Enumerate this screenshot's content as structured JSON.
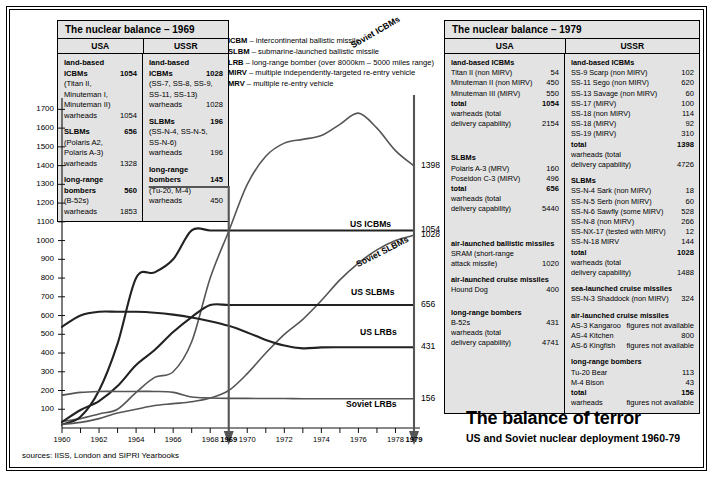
{
  "legend": [
    {
      "abbr": "ICBM",
      "desc": " – intercontinental ballistic missile"
    },
    {
      "abbr": "SLBM",
      "desc": " – submarine-launched ballistic missile"
    },
    {
      "abbr": "LRB",
      "desc": " – long-range bomber (over 8000km – 5000 miles range)"
    },
    {
      "abbr": "MIRV",
      "desc": " – multiple independently-targeted re-entry vehicle"
    },
    {
      "abbr": "MRV",
      "desc": " – multiple re-entry vehicle"
    }
  ],
  "table1969": {
    "title": "The nuclear balance – 1969",
    "head": [
      "USA",
      "USSR"
    ],
    "usa": [
      {
        "label": "land-based",
        "value": "",
        "bold": true
      },
      {
        "label": "ICBMs",
        "value": "1054",
        "bold": true
      },
      {
        "label": "(Titan II,",
        "value": ""
      },
      {
        "label": "Minuteman I,",
        "value": ""
      },
      {
        "label": "Minuteman II)",
        "value": ""
      },
      {
        "label": "warheads",
        "value": "1054"
      },
      {
        "label": "",
        "value": "",
        "gap": true
      },
      {
        "label": "SLBMs",
        "value": "656",
        "bold": true
      },
      {
        "label": "(Polaris A2,",
        "value": ""
      },
      {
        "label": "Polaris A-3)",
        "value": ""
      },
      {
        "label": "warheads",
        "value": "1328"
      },
      {
        "label": "",
        "value": "",
        "gap": true
      },
      {
        "label": "long-range",
        "value": "",
        "bold": true
      },
      {
        "label": "bombers",
        "value": "560",
        "bold": true
      },
      {
        "label": "(B-52s)",
        "value": ""
      },
      {
        "label": "warheads",
        "value": "1853"
      }
    ],
    "ussr": [
      {
        "label": "land-based",
        "value": "",
        "bold": true
      },
      {
        "label": "ICBMs",
        "value": "1028",
        "bold": true
      },
      {
        "label": "(SS-7, SS-8, SS-9,",
        "value": ""
      },
      {
        "label": "SS-11, SS-13)",
        "value": ""
      },
      {
        "label": "warheads",
        "value": "1028"
      },
      {
        "label": "",
        "value": "",
        "gap": true
      },
      {
        "label": "SLBMs",
        "value": "196",
        "bold": true
      },
      {
        "label": "(SS-N-4, SS-N-5,",
        "value": ""
      },
      {
        "label": "SS-N-6)",
        "value": ""
      },
      {
        "label": "warheads",
        "value": "196"
      },
      {
        "label": "",
        "value": "",
        "gap": true
      },
      {
        "label": "long-range",
        "value": "",
        "bold": true
      },
      {
        "label": "bombers",
        "value": "145",
        "bold": true
      },
      {
        "label": "(Tu-20, M-4)",
        "value": ""
      },
      {
        "label": "warheads",
        "value": "450"
      }
    ]
  },
  "table1979": {
    "title": "The nuclear balance – 1979",
    "head": [
      "USA",
      "USSR"
    ],
    "usa": [
      {
        "label": "land-based ICBMs",
        "value": "",
        "bold": true
      },
      {
        "label": "Titan II (non MIRV)",
        "value": "54"
      },
      {
        "label": "Minuteman II (non MIRV)",
        "value": "450"
      },
      {
        "label": "Minuteman III (MIRV)",
        "value": "550"
      },
      {
        "label": "total",
        "value": "1054",
        "bold": true
      },
      {
        "label": "warheads (total",
        "value": ""
      },
      {
        "label": "delivery capability)",
        "value": "2154"
      },
      {
        "label": "",
        "value": "",
        "gap": true
      },
      {
        "label": "",
        "value": "",
        "gap": true
      },
      {
        "label": "",
        "value": "",
        "gap": true
      },
      {
        "label": "",
        "value": "",
        "gap": true
      },
      {
        "label": "SLBMs",
        "value": "",
        "bold": true
      },
      {
        "label": "Polaris A-3 (MRV)",
        "value": "160"
      },
      {
        "label": "Poseidon C-3 (MIRV)",
        "value": "496"
      },
      {
        "label": "total",
        "value": "656",
        "bold": true
      },
      {
        "label": "warheads (total",
        "value": ""
      },
      {
        "label": "delivery capability)",
        "value": "5440"
      },
      {
        "label": "",
        "value": "",
        "gap": true
      },
      {
        "label": "",
        "value": "",
        "gap": true
      },
      {
        "label": "",
        "value": "",
        "gap": true
      },
      {
        "label": "",
        "value": "",
        "gap": true
      },
      {
        "label": "air-launched ballistic missiles",
        "value": "",
        "bold": true
      },
      {
        "label": "SRAM (short-range",
        "value": ""
      },
      {
        "label": "attack missile)",
        "value": "1020"
      },
      {
        "label": "",
        "value": "",
        "gap": true
      },
      {
        "label": "air-launched cruise missiles",
        "value": "",
        "bold": true
      },
      {
        "label": "Hound Dog",
        "value": "400"
      },
      {
        "label": "",
        "value": "",
        "gap": true
      },
      {
        "label": "",
        "value": "",
        "gap": true
      },
      {
        "label": "long-range bombers",
        "value": "",
        "bold": true
      },
      {
        "label": "B-52s",
        "value": "431"
      },
      {
        "label": "warheads (total",
        "value": ""
      },
      {
        "label": "delivery capability)",
        "value": "4741"
      }
    ],
    "ussr": [
      {
        "label": "land-based ICBMs",
        "value": "",
        "bold": true
      },
      {
        "label": "SS-9 Scarp (non MIRV)",
        "value": "102"
      },
      {
        "label": "SS-11 Sego (non MIRV)",
        "value": "620"
      },
      {
        "label": "SS-13 Savage (non MIRV)",
        "value": "60"
      },
      {
        "label": "SS-17 (MIRV)",
        "value": "100"
      },
      {
        "label": "SS-18 (non MIRV)",
        "value": "114"
      },
      {
        "label": "SS-18 (MIRV)",
        "value": "92"
      },
      {
        "label": "SS-19 (MIRV)",
        "value": "310"
      },
      {
        "label": "total",
        "value": "1398",
        "bold": true
      },
      {
        "label": "warheads (total",
        "value": ""
      },
      {
        "label": "delivery capability)",
        "value": "4726"
      },
      {
        "label": "",
        "value": "",
        "gap": true
      },
      {
        "label": "SLBMs",
        "value": "",
        "bold": true
      },
      {
        "label": "SS-N-4 Sark (non MIRV)",
        "value": "18"
      },
      {
        "label": "SS-N-5 Serb (non MIRV)",
        "value": "60"
      },
      {
        "label": "SS-N-6 Sawfly (some MIRV)",
        "value": "528"
      },
      {
        "label": "SS-N-8 (non MIRV)",
        "value": "266"
      },
      {
        "label": "SS-NX-17 (tested with MIRV)",
        "value": "12"
      },
      {
        "label": "SS-N-18 MIRV",
        "value": "144"
      },
      {
        "label": "total",
        "value": "1028",
        "bold": true
      },
      {
        "label": "warheads (total",
        "value": ""
      },
      {
        "label": "delivery capability)",
        "value": "1488"
      },
      {
        "label": "",
        "value": "",
        "gap": true
      },
      {
        "label": "sea-launched cruise missiles",
        "value": "",
        "bold": true
      },
      {
        "label": "SS-N-3 Shaddock (non MIRV)",
        "value": "324"
      },
      {
        "label": "",
        "value": "",
        "gap": true
      },
      {
        "label": "air-launched cruise missiles",
        "value": "",
        "bold": true
      },
      {
        "label": "AS-3 Kangaroo",
        "value": "figures not available"
      },
      {
        "label": "AS-4 Kitchen",
        "value": "800"
      },
      {
        "label": "AS-6 Kingfish",
        "value": "figures not available"
      },
      {
        "label": "",
        "value": "",
        "gap": true
      },
      {
        "label": "long-range bombers",
        "value": "",
        "bold": true
      },
      {
        "label": "Tu-20 Bear",
        "value": "113"
      },
      {
        "label": "M-4 Bison",
        "value": "43"
      },
      {
        "label": "total",
        "value": "156",
        "bold": true
      },
      {
        "label": "warheads",
        "value": "figures not available"
      }
    ]
  },
  "title": {
    "main": "The balance of terror",
    "sub": "US and Soviet nuclear deployment 1960-79"
  },
  "sources": "sources: IISS, London and SIPRI Yearbooks",
  "chart_data": {
    "type": "line",
    "title": "The balance of terror",
    "subtitle": "US and Soviet nuclear deployment 1960-79",
    "xlabel": "",
    "ylabel": "",
    "xlim": [
      1960,
      1979
    ],
    "ylim": [
      0,
      1750
    ],
    "grid": false,
    "legend_position": "inline-end-labels",
    "yticks": [
      100,
      200,
      300,
      400,
      500,
      600,
      700,
      800,
      900,
      1000,
      1100,
      1200,
      1300,
      1400,
      1500,
      1600,
      1700
    ],
    "xticks": [
      1960,
      1961,
      1962,
      1963,
      1964,
      1965,
      1966,
      1967,
      1968,
      1969,
      1970,
      1971,
      1972,
      1973,
      1974,
      1975,
      1976,
      1977,
      1978,
      1979
    ],
    "xtick_labels": [
      "1960",
      "",
      "1962",
      "",
      "1964",
      "",
      "1966",
      "",
      "1968",
      "1969",
      "1970",
      "",
      "1972",
      "",
      "1974",
      "",
      "1976",
      "",
      "1978",
      "1979"
    ],
    "marker_years": [
      "1969",
      "1979"
    ],
    "series": [
      {
        "name": "Soviet ICBMs",
        "end_value": 1398,
        "color": "#555555",
        "x": [
          1960,
          1961,
          1962,
          1963,
          1964,
          1965,
          1966,
          1967,
          1968,
          1969,
          1970,
          1971,
          1972,
          1973,
          1974,
          1975,
          1976,
          1977,
          1978,
          1979
        ],
        "values": [
          35,
          50,
          75,
          100,
          190,
          270,
          300,
          460,
          800,
          1050,
          1300,
          1450,
          1520,
          1540,
          1560,
          1620,
          1680,
          1600,
          1480,
          1398
        ]
      },
      {
        "name": "US ICBMs",
        "end_value": 1054,
        "color": "#222222",
        "x": [
          1960,
          1961,
          1962,
          1963,
          1964,
          1965,
          1966,
          1967,
          1968,
          1969,
          1970,
          1971,
          1972,
          1973,
          1974,
          1975,
          1976,
          1977,
          1978,
          1979
        ],
        "values": [
          18,
          60,
          200,
          450,
          800,
          830,
          900,
          1054,
          1054,
          1054,
          1054,
          1054,
          1054,
          1054,
          1054,
          1054,
          1054,
          1054,
          1054,
          1054
        ]
      },
      {
        "name": "Soviet SLBMs",
        "end_value": 1028,
        "color": "#555555",
        "x": [
          1960,
          1961,
          1962,
          1963,
          1964,
          1965,
          1966,
          1967,
          1968,
          1969,
          1970,
          1971,
          1972,
          1973,
          1974,
          1975,
          1976,
          1977,
          1978,
          1979
        ],
        "values": [
          20,
          30,
          50,
          80,
          100,
          120,
          130,
          140,
          160,
          200,
          290,
          400,
          500,
          580,
          680,
          790,
          880,
          950,
          1000,
          1028
        ]
      },
      {
        "name": "US SLBMs",
        "end_value": 656,
        "color": "#222222",
        "x": [
          1960,
          1961,
          1962,
          1963,
          1964,
          1965,
          1966,
          1967,
          1968,
          1969,
          1970,
          1971,
          1972,
          1973,
          1974,
          1975,
          1976,
          1977,
          1978,
          1979
        ],
        "values": [
          32,
          96,
          144,
          224,
          336,
          416,
          512,
          592,
          656,
          656,
          656,
          656,
          656,
          656,
          656,
          656,
          656,
          656,
          656,
          656
        ]
      },
      {
        "name": "US LRBs",
        "end_value": 431,
        "color": "#222222",
        "x": [
          1960,
          1961,
          1962,
          1963,
          1964,
          1965,
          1966,
          1967,
          1968,
          1969,
          1970,
          1971,
          1972,
          1973,
          1974,
          1975,
          1976,
          1977,
          1978,
          1979
        ],
        "values": [
          540,
          600,
          620,
          620,
          620,
          615,
          605,
          590,
          570,
          545,
          510,
          470,
          440,
          425,
          430,
          431,
          431,
          431,
          431,
          431
        ]
      },
      {
        "name": "Soviet LRBs",
        "end_value": 156,
        "color": "#555555",
        "x": [
          1960,
          1961,
          1962,
          1963,
          1964,
          1965,
          1966,
          1967,
          1968,
          1969,
          1970,
          1971,
          1972,
          1973,
          1974,
          1975,
          1976,
          1977,
          1978,
          1979
        ],
        "values": [
          175,
          190,
          195,
          195,
          195,
          195,
          190,
          165,
          160,
          158,
          158,
          157,
          157,
          156,
          156,
          156,
          156,
          156,
          156,
          156
        ]
      }
    ]
  }
}
